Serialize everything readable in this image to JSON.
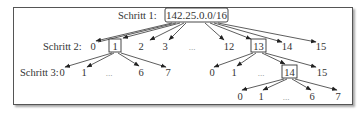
{
  "diagram": {
    "steps": [
      {
        "label": "Schritt 1:"
      },
      {
        "label": "Schritt 2:"
      },
      {
        "label": "Schritt 3:"
      }
    ],
    "root": {
      "label": "142.25.0.0/16"
    },
    "level2": [
      {
        "label": "0",
        "selected": false
      },
      {
        "label": "1",
        "selected": true
      },
      {
        "label": "2",
        "selected": false
      },
      {
        "label": "3",
        "selected": false
      },
      {
        "label": "...",
        "ellipsis": true
      },
      {
        "label": "12",
        "selected": false
      },
      {
        "label": "13",
        "selected": true
      },
      {
        "label": "14",
        "selected": false
      },
      {
        "label": "15",
        "selected": false
      }
    ],
    "level3_left": [
      {
        "label": "0"
      },
      {
        "label": "1"
      },
      {
        "label": "...",
        "ellipsis": true
      },
      {
        "label": "6"
      },
      {
        "label": "7"
      }
    ],
    "level3_right": [
      {
        "label": "0"
      },
      {
        "label": "1"
      },
      {
        "label": "...",
        "ellipsis": true
      },
      {
        "label": "14",
        "selected": true
      },
      {
        "label": "15"
      }
    ],
    "level4": [
      {
        "label": "0"
      },
      {
        "label": "1"
      },
      {
        "label": "...",
        "ellipsis": true
      },
      {
        "label": "6"
      },
      {
        "label": "7"
      }
    ]
  }
}
